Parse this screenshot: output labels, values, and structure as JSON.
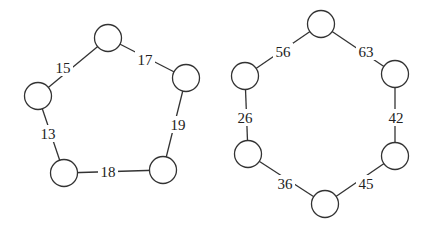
{
  "graphs": [
    {
      "name": "pentagon-graph",
      "nodes": [
        {
          "id": "p0",
          "cx": 108,
          "cy": 38
        },
        {
          "id": "p1",
          "cx": 186,
          "cy": 78
        },
        {
          "id": "p2",
          "cx": 163,
          "cy": 170
        },
        {
          "id": "p3",
          "cx": 64,
          "cy": 173
        },
        {
          "id": "p4",
          "cx": 38,
          "cy": 96
        }
      ],
      "edges": [
        {
          "from": "p4",
          "to": "p0",
          "weight": "15",
          "lx": 63,
          "ly": 68
        },
        {
          "from": "p0",
          "to": "p1",
          "weight": "17",
          "lx": 145,
          "ly": 60
        },
        {
          "from": "p1",
          "to": "p2",
          "weight": "19",
          "lx": 178,
          "ly": 125
        },
        {
          "from": "p2",
          "to": "p3",
          "weight": "18",
          "lx": 108,
          "ly": 172
        },
        {
          "from": "p3",
          "to": "p4",
          "weight": "13",
          "lx": 48,
          "ly": 134
        }
      ]
    },
    {
      "name": "hexagon-graph",
      "nodes": [
        {
          "id": "h0",
          "cx": 321,
          "cy": 24
        },
        {
          "id": "h1",
          "cx": 395,
          "cy": 74
        },
        {
          "id": "h2",
          "cx": 395,
          "cy": 156
        },
        {
          "id": "h3",
          "cx": 325,
          "cy": 204
        },
        {
          "id": "h4",
          "cx": 248,
          "cy": 154
        },
        {
          "id": "h5",
          "cx": 245,
          "cy": 76
        }
      ],
      "edges": [
        {
          "from": "h5",
          "to": "h0",
          "weight": "56",
          "lx": 283,
          "ly": 52
        },
        {
          "from": "h0",
          "to": "h1",
          "weight": "63",
          "lx": 366,
          "ly": 52
        },
        {
          "from": "h1",
          "to": "h2",
          "weight": "42",
          "lx": 396,
          "ly": 118
        },
        {
          "from": "h2",
          "to": "h3",
          "weight": "45",
          "lx": 366,
          "ly": 184
        },
        {
          "from": "h3",
          "to": "h4",
          "weight": "36",
          "lx": 285,
          "ly": 184
        },
        {
          "from": "h4",
          "to": "h5",
          "weight": "26",
          "lx": 245,
          "ly": 118
        }
      ]
    }
  ],
  "node_radius": 13.5,
  "colors": {
    "stroke": "#333333",
    "background": "#ffffff"
  }
}
